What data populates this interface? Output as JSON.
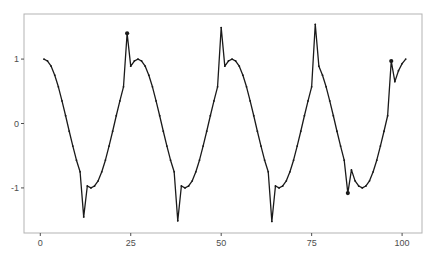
{
  "chart_data": {
    "type": "line",
    "title": "",
    "xlabel": "",
    "ylabel": "",
    "xlim": [
      -4.5,
      105.5
    ],
    "ylim": [
      -1.7,
      1.7
    ],
    "grid": false,
    "legend": null,
    "x_ticks": [
      0,
      25,
      50,
      75,
      100
    ],
    "x_tick_labels": [
      "0",
      "25",
      "50",
      "75",
      "100"
    ],
    "y_ticks": [
      -1,
      0,
      1
    ],
    "y_tick_labels": [
      "-1",
      "0",
      "1"
    ],
    "series": [
      {
        "name": "series",
        "color": "#1a1a1a",
        "x": [
          1,
          2,
          3,
          4,
          5,
          6,
          7,
          8,
          9,
          10,
          11,
          12,
          13,
          14,
          15,
          16,
          17,
          18,
          19,
          20,
          21,
          22,
          23,
          24,
          25,
          26,
          27,
          28,
          29,
          30,
          31,
          32,
          33,
          34,
          35,
          36,
          37,
          38,
          39,
          40,
          41,
          42,
          43,
          44,
          45,
          46,
          47,
          48,
          49,
          50,
          51,
          52,
          53,
          54,
          55,
          56,
          57,
          58,
          59,
          60,
          61,
          62,
          63,
          64,
          65,
          66,
          67,
          68,
          69,
          70,
          71,
          72,
          73,
          74,
          75,
          76,
          77,
          78,
          79,
          80,
          81,
          82,
          83,
          84,
          85,
          86,
          87,
          88,
          89,
          90,
          91,
          92,
          93,
          94,
          95,
          96,
          97,
          98,
          99,
          100,
          101
        ],
        "values": [
          1.0,
          0.97,
          0.89,
          0.75,
          0.57,
          0.35,
          0.12,
          -0.12,
          -0.35,
          -0.57,
          -0.75,
          -1.45,
          -0.97,
          -1.0,
          -0.97,
          -0.89,
          -0.75,
          -0.57,
          -0.35,
          -0.12,
          0.12,
          0.35,
          0.57,
          1.4,
          0.89,
          0.97,
          1.0,
          0.97,
          0.89,
          0.75,
          0.57,
          0.35,
          0.12,
          -0.12,
          -0.35,
          -0.57,
          -0.75,
          -1.51,
          -0.97,
          -1.0,
          -0.97,
          -0.89,
          -0.75,
          -0.57,
          -0.35,
          -0.12,
          0.12,
          0.35,
          0.57,
          1.49,
          0.89,
          0.97,
          1.0,
          0.97,
          0.89,
          0.75,
          0.57,
          0.35,
          0.12,
          -0.12,
          -0.35,
          -0.57,
          -0.75,
          -1.52,
          -0.97,
          -1.0,
          -0.97,
          -0.89,
          -0.75,
          -0.57,
          -0.35,
          -0.12,
          0.12,
          0.35,
          0.57,
          1.54,
          0.89,
          0.75,
          0.57,
          0.35,
          0.12,
          -0.12,
          -0.35,
          -0.57,
          -1.08,
          -0.72,
          -0.89,
          -0.97,
          -1.0,
          -0.97,
          -0.89,
          -0.75,
          -0.57,
          -0.35,
          -0.12,
          0.12,
          0.97,
          0.65,
          0.82,
          0.93,
          1.0
        ],
        "highlighted_points": [
          {
            "x": 24,
            "y": 1.4
          },
          {
            "x": 85,
            "y": -1.08
          },
          {
            "x": 97,
            "y": 0.97
          }
        ]
      }
    ]
  },
  "colors": {
    "panel_border": "#b3b3b3",
    "line": "#1a1a1a",
    "tick": "#4d4d4d",
    "background": "#ffffff"
  }
}
